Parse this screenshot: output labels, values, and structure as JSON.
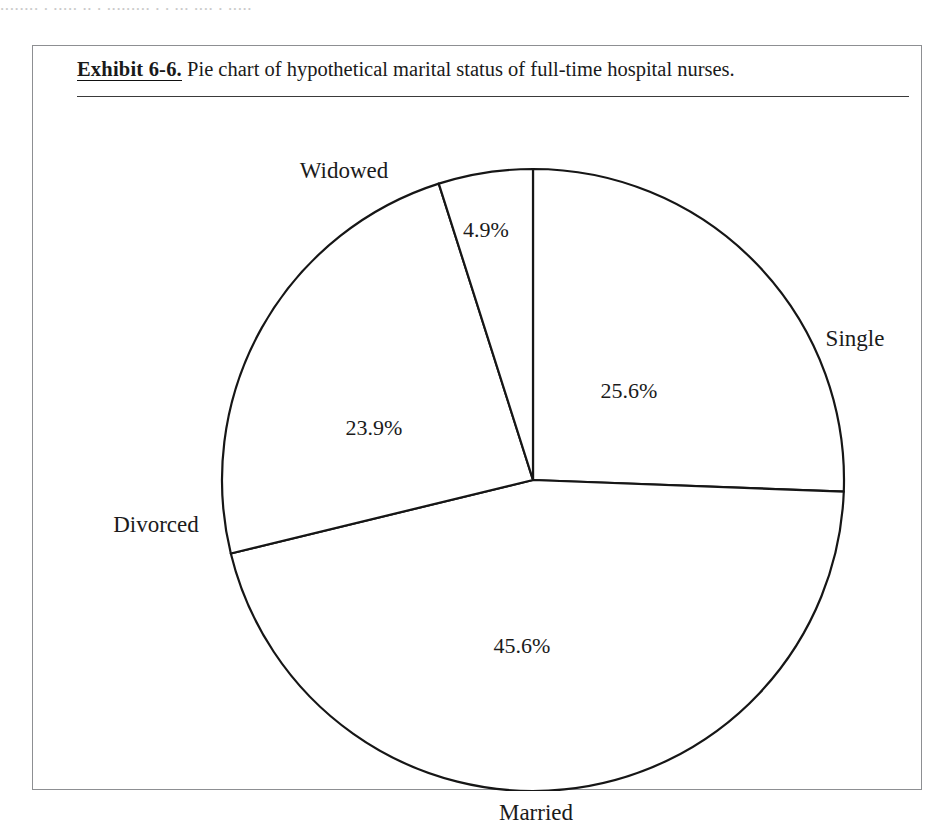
{
  "page": {
    "bleed_text": "........ . ..... .. . ......... . . ... .... . ....."
  },
  "exhibit": {
    "label": "Exhibit 6-6.",
    "caption": "Pie chart of hypothetical marital status of full-time hospital nurses."
  },
  "chart_data": {
    "type": "pie",
    "title": "Pie chart of hypothetical marital status of full-time hospital nurses.",
    "categories": [
      "Single",
      "Married",
      "Divorced",
      "Widowed"
    ],
    "values": [
      25.6,
      45.6,
      23.9,
      4.9
    ],
    "value_labels": [
      "25.6%",
      "45.6%",
      "23.9%",
      "4.9%"
    ],
    "units": "percent",
    "start_angle_deg": 0,
    "direction": "clockwise",
    "legend": "none",
    "grid": false,
    "slice_fill": "#ffffff",
    "slice_stroke": "#161616",
    "slices": [
      {
        "name": "Single",
        "value": 25.6,
        "label": "25.6%",
        "start_deg": 0.0,
        "end_deg": 92.16,
        "label_x": 596,
        "label_y": 345,
        "name_x": 822,
        "name_y": 292
      },
      {
        "name": "Married",
        "value": 45.6,
        "label": "45.6%",
        "start_deg": 92.16,
        "end_deg": 256.32,
        "label_x": 489,
        "label_y": 600,
        "name_x": 503,
        "name_y": 766
      },
      {
        "name": "Divorced",
        "value": 23.9,
        "label": "23.9%",
        "start_deg": 256.32,
        "end_deg": 342.36,
        "label_x": 341,
        "label_y": 382,
        "name_x": 123,
        "name_y": 478
      },
      {
        "name": "Widowed",
        "value": 4.9,
        "label": "4.9%",
        "start_deg": 342.36,
        "end_deg": 360.0,
        "label_x": 453,
        "label_y": 184,
        "name_x": 311,
        "name_y": 124
      }
    ],
    "geometry": {
      "center_x": 500,
      "center_y": 434,
      "radius": 311
    }
  },
  "colors": {
    "frame": "#8d8f92",
    "rule": "#3a3a3a",
    "ink": "#161616",
    "paper": "#ffffff"
  }
}
